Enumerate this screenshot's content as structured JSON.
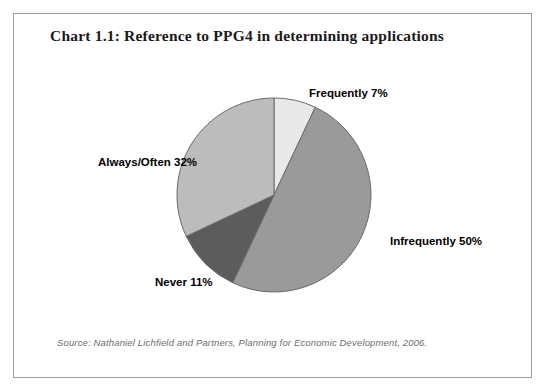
{
  "chart_title": "Chart 1.1: Reference to PPG4 in determining applications",
  "source_note": "Source: Nathaniel Lichfield and Partners, Planning for Economic Development, 2006.",
  "labels": {
    "frequently": "Frequently 7%",
    "infrequently": "Infrequently 50%",
    "always_often": "Always/Often 32%",
    "never": "Never 11%"
  },
  "chart_data": {
    "type": "pie",
    "title": "Chart 1.1: Reference to PPG4 in determining applications",
    "xlabel": "",
    "ylabel": "",
    "legend_position": "none",
    "grid": false,
    "start_angle_deg": 0,
    "direction": "clockwise",
    "unit": "%",
    "categories": [
      "Frequently",
      "Infrequently",
      "Never",
      "Always/Often"
    ],
    "values": [
      7,
      50,
      11,
      32
    ],
    "total": 100,
    "slices": [
      {
        "name": "Frequently",
        "value": 7,
        "label": "Frequently 7%",
        "color": "#e9e9e9",
        "start_deg": 0,
        "end_deg": 25.2
      },
      {
        "name": "Infrequently",
        "value": 50,
        "label": "Infrequently 50%",
        "color": "#9a9a9a",
        "start_deg": 25.2,
        "end_deg": 205.2
      },
      {
        "name": "Never",
        "value": 11,
        "label": "Never 11%",
        "color": "#5c5c5c",
        "start_deg": 205.2,
        "end_deg": 244.8
      },
      {
        "name": "Always/Often",
        "value": 32,
        "label": "Always/Often 32%",
        "color": "#bcbcbc",
        "start_deg": 244.8,
        "end_deg": 360
      }
    ],
    "geometry": {
      "center_x": 261,
      "center_y": 182,
      "radius": 97,
      "outline_color": "#6b6b6b"
    }
  },
  "colors": {
    "frame_border": "#9e9e9e",
    "background": "#ffffff",
    "title_text": "#1a1a1a",
    "label_text": "#000000",
    "source_text": "#6d6d6d"
  }
}
